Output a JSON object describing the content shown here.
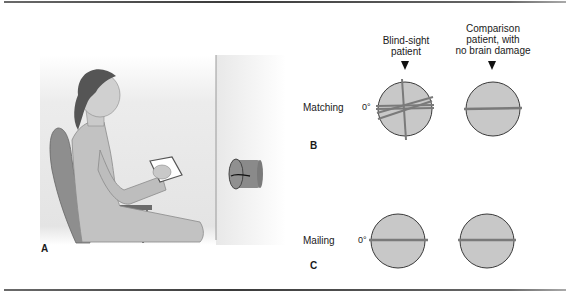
{
  "figure": {
    "panels": [
      {
        "id": "A",
        "label": "A"
      },
      {
        "id": "B",
        "label": "B"
      },
      {
        "id": "C",
        "label": "C"
      }
    ],
    "columns": [
      {
        "header_line1": "Blind-sight",
        "header_line2": "patient",
        "header_line3": ""
      },
      {
        "header_line1": "Comparison",
        "header_line2": "patient, with",
        "header_line3": "no brain damage"
      }
    ],
    "rows": [
      {
        "label": "Matching",
        "angle_label": "0°",
        "panel": "B"
      },
      {
        "label": "Mailing",
        "angle_label": "0°",
        "panel": "C"
      }
    ],
    "colors": {
      "circle_fill": "#c8c8c8",
      "circle_stroke": "#3a3a3a",
      "line_color": "#7a7a7a",
      "wall": "#e6e6e6"
    }
  }
}
